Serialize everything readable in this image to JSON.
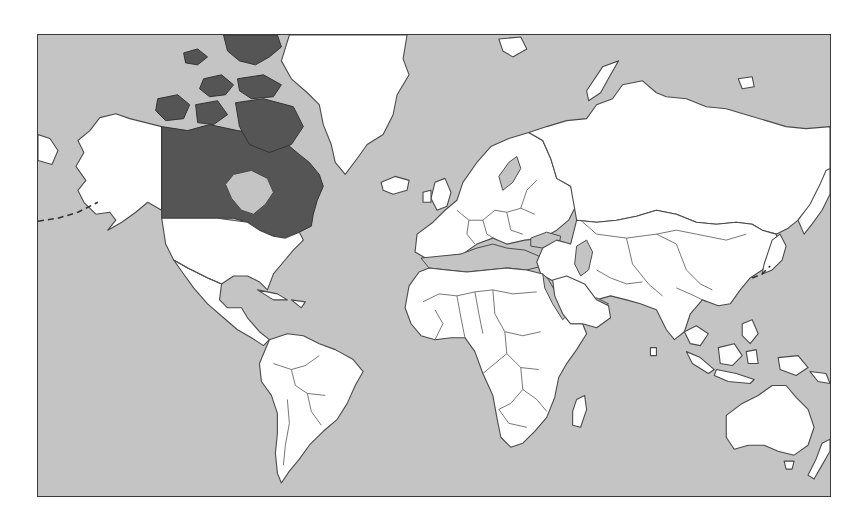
{
  "map": {
    "projection": "Mercator",
    "highlighted_country": "Canada",
    "colors": {
      "ocean": "#c4c4c4",
      "land": "#ffffff",
      "highlight": "#555555",
      "border": "#4a4a4a",
      "frame": "#3a3a3a",
      "page_background": "#ffffff"
    },
    "regions": [
      {
        "name": "Canada",
        "style": "highlighted"
      },
      {
        "name": "United States",
        "style": "land"
      },
      {
        "name": "Alaska",
        "style": "land"
      },
      {
        "name": "Greenland",
        "style": "land"
      },
      {
        "name": "Mexico and Central America",
        "style": "land"
      },
      {
        "name": "South America",
        "style": "land"
      },
      {
        "name": "Europe",
        "style": "land"
      },
      {
        "name": "Russia",
        "style": "land"
      },
      {
        "name": "Asia",
        "style": "land"
      },
      {
        "name": "Africa",
        "style": "land"
      },
      {
        "name": "Australia",
        "style": "land"
      },
      {
        "name": "New Zealand",
        "style": "land"
      },
      {
        "name": "Indonesia",
        "style": "land"
      },
      {
        "name": "Japan",
        "style": "land"
      },
      {
        "name": "Iceland",
        "style": "land"
      },
      {
        "name": "Madagascar",
        "style": "land"
      }
    ],
    "water_bodies": [
      "Mediterranean Sea",
      "Black Sea",
      "Caspian Sea",
      "Baltic Sea",
      "Red Sea",
      "Persian Gulf",
      "Hudson Bay"
    ],
    "annotations": [
      "dashed maritime boundary near Alaska",
      "dashed maritime boundary near Japan"
    ]
  }
}
